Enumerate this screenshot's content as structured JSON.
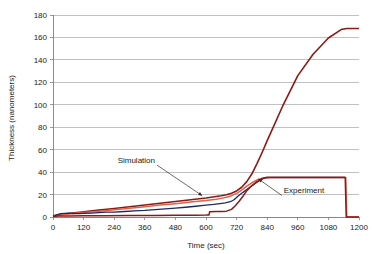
{
  "chart_data": {
    "type": "line",
    "title": "",
    "xlabel": "Time (sec)",
    "ylabel": "Thickness (nanometers)",
    "xlim": [
      0,
      1200
    ],
    "ylim": [
      0,
      180
    ],
    "xticks": [
      0,
      120,
      240,
      360,
      480,
      600,
      720,
      840,
      960,
      1080,
      1200
    ],
    "yticks": [
      0,
      20,
      40,
      60,
      80,
      100,
      120,
      140,
      160,
      180
    ],
    "grid": "horizontal",
    "legend": "none",
    "annotations": [
      {
        "label": "Simulation",
        "text_x": 400,
        "text_y": 48,
        "point_x": 585,
        "point_y": 19
      },
      {
        "label": "Experiment",
        "text_x": 905,
        "text_y": 21,
        "point_x": 805,
        "point_y": 34
      }
    ],
    "series": [
      {
        "name": "simulation-upper-branch",
        "color": "#8c1a14",
        "width": 1.6,
        "x": [
          0,
          30,
          60,
          120,
          180,
          240,
          300,
          360,
          420,
          480,
          540,
          600,
          640,
          660,
          680,
          700,
          720,
          740,
          760,
          780,
          800,
          820,
          840,
          900,
          960,
          1020,
          1080,
          1130,
          1152,
          1200
        ],
        "y": [
          1,
          2.2,
          3.1,
          4.6,
          6.1,
          7.6,
          9.2,
          10.7,
          12.3,
          13.8,
          15.4,
          17.0,
          18.3,
          19.0,
          19.9,
          21.2,
          23.2,
          26.5,
          31.5,
          38.5,
          47.5,
          57.5,
          68.0,
          98.5,
          126.0,
          145.0,
          159.5,
          167.0,
          168.0,
          168.0
        ]
      },
      {
        "name": "simulation-lower-branch",
        "color": "#e0604c",
        "width": 1.5,
        "x": [
          0,
          30,
          60,
          120,
          180,
          240,
          300,
          360,
          420,
          480,
          540,
          600,
          640,
          660,
          680,
          700,
          720,
          740,
          760,
          780,
          800,
          820,
          835,
          860,
          900,
          1000,
          1100,
          1148,
          1152,
          1200
        ],
        "y": [
          0.8,
          1.8,
          2.6,
          3.9,
          5.2,
          6.5,
          7.9,
          9.2,
          10.6,
          11.9,
          13.3,
          14.7,
          15.9,
          16.6,
          17.6,
          19.0,
          21.0,
          24.0,
          27.5,
          30.5,
          33.0,
          34.6,
          35.2,
          35.3,
          35.3,
          35.3,
          35.3,
          35.3,
          0,
          0
        ]
      },
      {
        "name": "experiment-trace",
        "color": "#1b2a63",
        "width": 1.3,
        "x": [
          0,
          15,
          30,
          45,
          60,
          80,
          100,
          120,
          150,
          180,
          210,
          240,
          280,
          320,
          360,
          400,
          440,
          480,
          520,
          560,
          600,
          630,
          655,
          675,
          695,
          710,
          725,
          740,
          760,
          780,
          800,
          815,
          825,
          835,
          850,
          880,
          930,
          990,
          1050,
          1110,
          1145
        ],
        "y": [
          0.6,
          2.0,
          3.0,
          3.2,
          3.4,
          3.1,
          3.0,
          3.2,
          3.5,
          3.9,
          4.3,
          4.4,
          4.9,
          5.4,
          5.9,
          6.6,
          7.2,
          7.9,
          8.7,
          9.6,
          10.5,
          11.2,
          12.0,
          12.6,
          13.6,
          15.4,
          18.4,
          21.2,
          24.4,
          27.8,
          31.0,
          33.2,
          34.4,
          35.2,
          35.3,
          35.3,
          35.3,
          35.3,
          35.3,
          35.3,
          35.3
        ]
      },
      {
        "name": "experiment-baseline",
        "color": "#8c1a14",
        "width": 1.5,
        "x": [
          0,
          20,
          60,
          120,
          200,
          300,
          400,
          480,
          560,
          600,
          612,
          614,
          640,
          660,
          680,
          700,
          715,
          730,
          745,
          760,
          780,
          800,
          818,
          832,
          850,
          900,
          1000,
          1100,
          1146,
          1150,
          1200
        ],
        "y": [
          0.5,
          0.8,
          1.0,
          1.1,
          1.2,
          1.3,
          1.4,
          1.5,
          1.6,
          1.7,
          1.8,
          4.6,
          4.8,
          5.0,
          5.2,
          6.8,
          10.0,
          14.0,
          18.5,
          23.5,
          28.0,
          31.5,
          33.8,
          35.0,
          35.3,
          35.3,
          35.3,
          35.3,
          35.3,
          0,
          0
        ]
      }
    ]
  }
}
